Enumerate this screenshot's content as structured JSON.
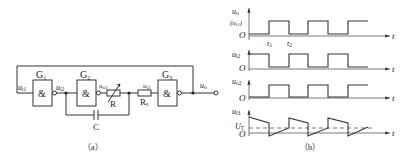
{
  "circuit": {
    "caption": "（a）",
    "gates": [
      {
        "name": "G",
        "sub": "1",
        "symbol": "&"
      },
      {
        "name": "G",
        "sub": "2",
        "symbol": "&"
      },
      {
        "name": "G",
        "sub": "3",
        "symbol": "&"
      }
    ],
    "labels": {
      "ui1": "u",
      "ui1_sub": "i1",
      "ui2": "u",
      "ui2_sub": "i2",
      "uo2": "u",
      "uo2_sub": "o2",
      "ui3": "u",
      "ui3_sub": "i3",
      "uo": "u",
      "uo_sub": "o",
      "R": "R",
      "Rs": "R",
      "Rs_sub": "s",
      "C": "C"
    }
  },
  "waveforms": {
    "caption": "（b）",
    "t_label": "t",
    "origin_label": "O",
    "t1": "t",
    "t1_sub": "1",
    "t2": "t",
    "t2_sub": "2",
    "UT": "U",
    "UT_sub": "T",
    "plots": [
      {
        "ylabel": "u",
        "ylabel_sub": "o",
        "ylabel2": "(u",
        "ylabel2_sub": "i1",
        "ylabel2_end": ")"
      },
      {
        "ylabel": "u",
        "ylabel_sub": "i2"
      },
      {
        "ylabel": "u",
        "ylabel_sub": "o2"
      },
      {
        "ylabel": "u",
        "ylabel_sub": "i3"
      }
    ]
  }
}
